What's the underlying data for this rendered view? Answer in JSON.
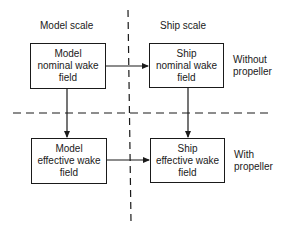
{
  "columns": {
    "model_scale": "Model scale",
    "ship_scale": "Ship scale"
  },
  "rows": {
    "without_propeller": [
      "Without",
      "propeller"
    ],
    "with_propeller": [
      "With",
      "propeller"
    ]
  },
  "boxes": {
    "model_nominal": [
      "Model",
      "nominal wake",
      "field"
    ],
    "ship_nominal": [
      "Ship",
      "nominal wake",
      "field"
    ],
    "model_effective": [
      "Model",
      "effective wake",
      "field"
    ],
    "ship_effective": [
      "Ship",
      "effective wake",
      "field"
    ]
  },
  "arrows": [
    {
      "from": "model_nominal",
      "to": "ship_nominal"
    },
    {
      "from": "model_nominal",
      "to": "model_effective"
    },
    {
      "from": "ship_nominal",
      "to": "ship_effective"
    },
    {
      "from": "model_effective",
      "to": "ship_effective"
    }
  ],
  "colors": {
    "ink": "#1a1a1a",
    "background": "#ffffff"
  }
}
